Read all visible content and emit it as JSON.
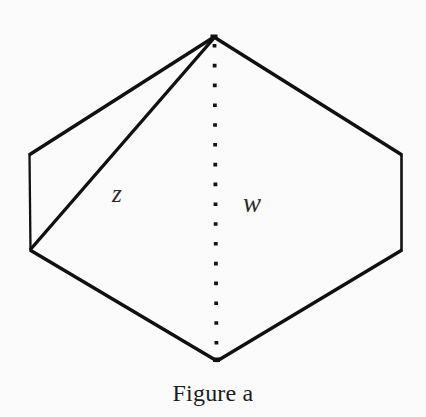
{
  "figure": {
    "caption": "Figure a",
    "background_color": "#fbfbfb",
    "stroke_color": "#111111",
    "labels": {
      "z": "z",
      "w": "w"
    },
    "geometry": {
      "description": "Hexagonal prism seen end-on: a hexagon outline with a solid diagonal labelled z from the top apex to the lower-left vertex and a dotted vertical axis labelled w from the top apex to the bottom apex.",
      "vertices": {
        "top_apex": [
          214,
          37
        ],
        "left_upper": [
          29,
          155
        ],
        "left_lower": [
          30,
          250
        ],
        "bottom_apex": [
          217,
          361
        ],
        "right_lower": [
          402,
          250
        ],
        "right_upper": [
          402,
          155
        ]
      },
      "hexagon_points": "214,37 29,155 30,250 217,361 402,250 402,155",
      "diagonal_z": {
        "from": [
          214,
          37
        ],
        "to": [
          30,
          250
        ]
      },
      "dotted_axis_w": {
        "from": [
          214,
          41
        ],
        "to": [
          216,
          357
        ]
      },
      "stroke_widths": {
        "outline": 3.2,
        "left_edge": 2.2,
        "diagonal": 3.2,
        "dot_size": 3.6
      },
      "dot_count": 16
    }
  }
}
